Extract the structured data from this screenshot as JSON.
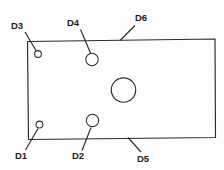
{
  "drawing": {
    "title": "Rectangular plate with hole callouts",
    "background_color": "#fdfdfd",
    "line_color": "#2b2b2b",
    "label_color": "#1c1c1c",
    "plate": {
      "name": "plate-outline",
      "shape": "quadrilateral",
      "points": [
        {
          "x": 27.5,
          "y": 41.5
        },
        {
          "x": 215.0,
          "y": 39.0
        },
        {
          "x": 215.5,
          "y": 137.5
        },
        {
          "x": 28.5,
          "y": 139.5
        }
      ]
    },
    "holes": [
      {
        "name": "hole-d3",
        "label": "D3",
        "cx": 38.0,
        "cy": 54.0,
        "r": 3.4
      },
      {
        "name": "hole-d4",
        "label": "D4",
        "cx": 92.0,
        "cy": 59.5,
        "r": 6.2
      },
      {
        "name": "hole-center",
        "label": "",
        "cx": 123.5,
        "cy": 90.0,
        "r": 12.2
      },
      {
        "name": "hole-d1",
        "label": "D1",
        "cx": 39.5,
        "cy": 124.5,
        "r": 3.4
      },
      {
        "name": "hole-d2",
        "label": "D2",
        "cx": 92.5,
        "cy": 120.5,
        "r": 6.2
      }
    ],
    "leaders": [
      {
        "name": "leader-d3",
        "x1": 25.0,
        "y1": 32.0,
        "x2": 36.0,
        "y2": 50.5
      },
      {
        "name": "leader-d4",
        "x1": 80.5,
        "y1": 29.5,
        "x2": 90.5,
        "y2": 53.0
      },
      {
        "name": "leader-d6",
        "x1": 135.0,
        "y1": 25.5,
        "x2": 120.0,
        "y2": 40.5
      },
      {
        "name": "leader-d1",
        "x1": 25.5,
        "y1": 150.0,
        "x2": 38.0,
        "y2": 128.5
      },
      {
        "name": "leader-d2",
        "x1": 82.0,
        "y1": 150.5,
        "x2": 91.0,
        "y2": 127.5
      },
      {
        "name": "leader-d5",
        "x1": 141.0,
        "y1": 152.0,
        "x2": 128.0,
        "y2": 137.5
      }
    ],
    "labels": [
      {
        "name": "dim-label-d3",
        "text": "D3",
        "x": 11.0,
        "y": 21.0
      },
      {
        "name": "dim-label-d4",
        "text": "D4",
        "x": 67.0,
        "y": 18.0
      },
      {
        "name": "dim-label-d6",
        "text": "D6",
        "x": 135.0,
        "y": 13.0
      },
      {
        "name": "dim-label-d1",
        "text": "D1",
        "x": 15.0,
        "y": 151.0
      },
      {
        "name": "dim-label-d2",
        "text": "D2",
        "x": 72.0,
        "y": 151.0
      },
      {
        "name": "dim-label-d5",
        "text": "D5",
        "x": 137.0,
        "y": 154.0
      }
    ]
  }
}
